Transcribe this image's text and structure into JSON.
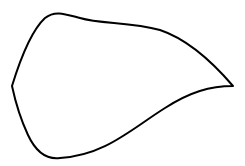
{
  "figure": {
    "stroke_color": "#000000",
    "fill_color": "#ffffff",
    "background": "#ffffff",
    "stroke_width": 2
  }
}
